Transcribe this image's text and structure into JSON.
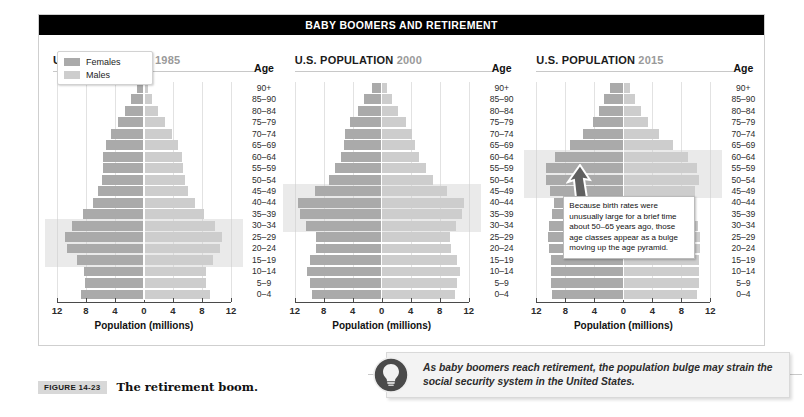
{
  "banner": {
    "title": "BABY BOOMERS AND RETIREMENT"
  },
  "legend": {
    "females_label": "Females",
    "males_label": "Males",
    "female_color": "#aaaaaa",
    "male_color": "#cdcdcd"
  },
  "axis": {
    "title": "Population (millions)",
    "ticks": [
      "12",
      "8",
      "4",
      "0",
      "4",
      "8",
      "12"
    ],
    "tick_values": [
      -12,
      -8,
      -4,
      0,
      4,
      8,
      12
    ],
    "age_header": "Age"
  },
  "callout": {
    "text": "Because birth rates were unusually large for a brief time about 50–65 years ago, those age classes appear as a bulge moving up the age pyramid."
  },
  "bulb_note": {
    "icon": "lightbulb-icon",
    "text": "As baby boomers reach retirement, the population bulge may strain the social security system in the United States."
  },
  "figure_caption": {
    "number": "FIGURE 14-23",
    "title": "The retirement boom."
  },
  "chart_data": [
    {
      "type": "bar",
      "title": "U.S. POPULATION",
      "year": "1985",
      "orientation": "population-pyramid",
      "xlabel": "Population (millions)",
      "ylabel": "Age",
      "xlim": [
        -12,
        12
      ],
      "grid": true,
      "categories": [
        "90+",
        "85–90",
        "80–84",
        "75–79",
        "70–74",
        "65–69",
        "60–64",
        "55–59",
        "50–54",
        "45–49",
        "40–44",
        "35–39",
        "30–34",
        "25–29",
        "20–24",
        "15–19",
        "10–14",
        "5–9",
        "0–4"
      ],
      "series": [
        {
          "name": "Females",
          "values": [
            1.0,
            1.8,
            2.6,
            3.6,
            4.6,
            5.3,
            5.6,
            5.7,
            5.8,
            6.3,
            7.1,
            8.4,
            9.9,
            10.9,
            10.6,
            9.3,
            8.3,
            8.2,
            8.7
          ]
        },
        {
          "name": "Males",
          "values": [
            0.6,
            1.1,
            1.9,
            2.9,
            3.9,
            4.7,
            5.2,
            5.4,
            5.6,
            6.1,
            7.0,
            8.3,
            9.8,
            10.8,
            10.5,
            9.5,
            8.6,
            8.5,
            9.1
          ]
        }
      ],
      "bulge_categories": [
        "30–34",
        "25–29",
        "20–24",
        "15–19"
      ]
    },
    {
      "type": "bar",
      "title": "U.S. POPULATION",
      "year": "2000",
      "orientation": "population-pyramid",
      "xlabel": "Population (millions)",
      "ylabel": "Age",
      "xlim": [
        -12,
        12
      ],
      "grid": true,
      "categories": [
        "90+",
        "85–90",
        "80–84",
        "75–79",
        "70–74",
        "65–69",
        "60–64",
        "55–59",
        "50–54",
        "45–49",
        "40–44",
        "35–39",
        "30–34",
        "25–29",
        "20–24",
        "15–19",
        "10–14",
        "5–9",
        "0–4"
      ],
      "series": [
        {
          "name": "Females",
          "values": [
            1.4,
            2.4,
            3.3,
            4.4,
            5.0,
            5.2,
            5.6,
            6.4,
            7.3,
            9.2,
            11.6,
            11.3,
            10.4,
            9.1,
            9.0,
            9.9,
            10.3,
            9.9,
            9.6
          ]
        },
        {
          "name": "Males",
          "values": [
            0.7,
            1.4,
            2.2,
            3.3,
            4.2,
            4.6,
            5.2,
            6.1,
            7.1,
            9.0,
            11.4,
            11.1,
            10.2,
            9.4,
            9.5,
            10.4,
            10.8,
            10.4,
            10.1
          ]
        }
      ],
      "bulge_categories": [
        "45–49",
        "40–44",
        "35–39",
        "30–34"
      ]
    },
    {
      "type": "bar",
      "title": "U.S. POPULATION",
      "year": "2015",
      "orientation": "population-pyramid",
      "xlabel": "Population (millions)",
      "ylabel": "Age",
      "xlim": [
        -12,
        12
      ],
      "grid": true,
      "categories": [
        "90+",
        "85–90",
        "80–84",
        "75–79",
        "70–74",
        "65–69",
        "60–64",
        "55–59",
        "50–54",
        "45–49",
        "40–44",
        "35–39",
        "30–34",
        "25–29",
        "20–24",
        "15–19",
        "10–14",
        "5–9",
        "0–4"
      ],
      "series": [
        {
          "name": "Females",
          "values": [
            1.9,
            2.6,
            3.3,
            4.2,
            5.6,
            7.4,
            9.4,
            10.6,
            10.7,
            10.1,
            9.6,
            9.8,
            10.2,
            10.4,
            10.2,
            10.0,
            10.0,
            10.0,
            9.8
          ]
        },
        {
          "name": "Males",
          "values": [
            0.9,
            1.6,
            2.4,
            3.4,
            4.9,
            6.8,
            8.9,
            10.2,
            10.4,
            9.9,
            9.5,
            9.8,
            10.3,
            10.6,
            10.6,
            10.4,
            10.4,
            10.4,
            10.2
          ]
        }
      ],
      "bulge_categories": [
        "60–64",
        "55–59",
        "50–54",
        "45–49"
      ]
    }
  ]
}
